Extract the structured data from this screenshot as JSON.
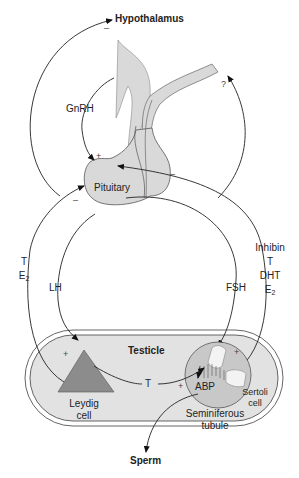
{
  "diagram": {
    "nodes": {
      "hypothalamus": "Hypothalamus",
      "pituitary": "Pituitary",
      "testicle": "Testicle",
      "leydig_line1": "Leydig",
      "leydig_line2": "cell",
      "seminiferous_line1": "Seminiferous",
      "seminiferous_line2": "tubule",
      "sertoli_line1": "Sertoli",
      "sertoli_line2": "cell",
      "abp": "ABP",
      "sperm": "Sperm"
    },
    "hormones": {
      "gnrh": "GnRH",
      "lh": "LH",
      "fsh": "FSH",
      "t_to_tubule": "T",
      "left_feedback_t": "T",
      "left_feedback_e": "E",
      "left_feedback_e_sub": "2",
      "right_feedback_inhibin": "Inhibin",
      "right_feedback_t": "T",
      "right_feedback_dht": "DHT",
      "right_feedback_e": "E",
      "right_feedback_e_sub": "2"
    },
    "signs": {
      "hypothalamus_minus": "–",
      "gnrh_plus": "+",
      "pituitary_left_minus": "–",
      "pituitary_right_minus": "–",
      "leydig_plus": "+",
      "tubule_top_plus": "+",
      "tubule_left_plus": "+",
      "unknown": "?"
    },
    "colors": {
      "gland_fill": "#d9d9d9",
      "testicle_fill": "#e2e2e2",
      "leydig_fill": "#8c8c8c",
      "tubule_fill": "#c8c8c8",
      "line": "#222222"
    }
  }
}
